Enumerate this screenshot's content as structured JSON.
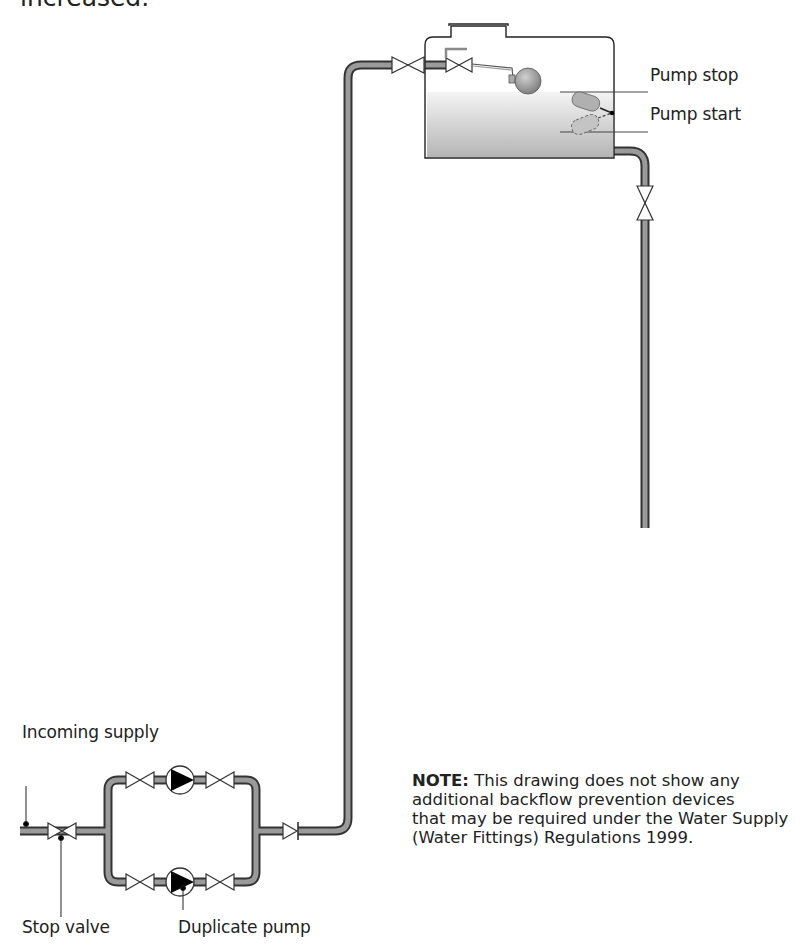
{
  "header": {
    "partial_text": "increased."
  },
  "labels": {
    "pump_stop": "Pump stop",
    "pump_start": "Pump start",
    "incoming_supply": "Incoming supply",
    "stop_valve": "Stop valve",
    "duplicate_pump": "Duplicate pump"
  },
  "note": {
    "prefix": "NOTE:",
    "line1": " This drawing does not show any",
    "line2": "additional backflow prevention devices",
    "line3": "that may be required under the Water Supply",
    "line4": "(Water Fittings) Regulations 1999."
  },
  "colors": {
    "pipe_fill": "#9a9a9a",
    "pipe_edge": "#333333",
    "water_top": "#f2f2f2",
    "water_bottom": "#b8b8b8",
    "pump_triangle": "#000000"
  },
  "components": [
    "incoming-supply-pipe",
    "stop-valve",
    "duplicate-pump-upper",
    "duplicate-pump-lower",
    "isolating-valves",
    "check-valve",
    "rising-main",
    "tank-inlet-valves",
    "float-valve",
    "storage-tank",
    "float-switch",
    "outlet-valve",
    "down-pipe"
  ]
}
